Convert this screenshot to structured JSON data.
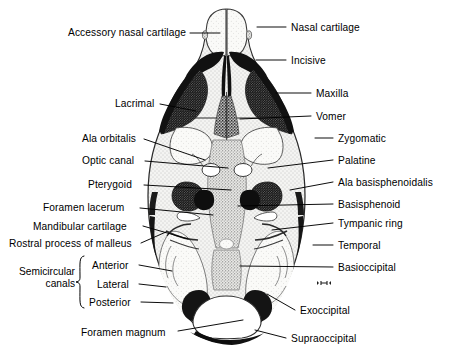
{
  "figure": {
    "colors": {
      "ink": "#000000",
      "background": "#ffffff",
      "bone_dark": "#1a1a1a",
      "bone_mid": "#7a7a7a",
      "bone_light": "#dcdcdc",
      "cartilage": "#f2f2f0"
    }
  },
  "labels_left": [
    {
      "id": "accessory-nasal-cartilage",
      "text": "Accessory nasal cartilage",
      "text_x": 68,
      "text_y": 27,
      "line": [
        [
          190,
          33
        ],
        [
          220,
          33
        ]
      ]
    },
    {
      "id": "lacrimal",
      "text": "Lacrimal",
      "text_x": 115,
      "text_y": 98,
      "line": [
        [
          160,
          104
        ],
        [
          196,
          111
        ]
      ]
    },
    {
      "id": "ala-orbitalis",
      "text": "Ala orbitalis",
      "text_x": 82,
      "text_y": 133,
      "line": [
        [
          144,
          139
        ],
        [
          205,
          160
        ]
      ]
    },
    {
      "id": "optic-canal",
      "text": "Optic canal",
      "text_x": 82,
      "text_y": 155,
      "line": [
        [
          145,
          161
        ],
        [
          228,
          168
        ]
      ]
    },
    {
      "id": "pterygoid",
      "text": "Pterygoid",
      "text_x": 88,
      "text_y": 179,
      "line": [
        [
          144,
          185
        ],
        [
          231,
          190
        ]
      ]
    },
    {
      "id": "foramen-lacerum",
      "text": "Foramen lacerum",
      "text_x": 43,
      "text_y": 202,
      "line": [
        [
          140,
          208
        ],
        [
          213,
          215
        ]
      ]
    },
    {
      "id": "mandibular-cartilage",
      "text": "Mandibular cartilage",
      "text_x": 33,
      "text_y": 221,
      "line": [
        [
          143,
          226
        ],
        [
          188,
          239
        ]
      ]
    },
    {
      "id": "rostral-process-of-malleus",
      "text": "Rostral process of malleus",
      "text_x": 9,
      "text_y": 238,
      "line": [
        [
          141,
          243
        ],
        [
          166,
          232
        ]
      ]
    },
    {
      "id": "anterior",
      "text": "Anterior",
      "text_x": 92,
      "text_y": 260,
      "line": [
        [
          139,
          265
        ],
        [
          172,
          271
        ]
      ]
    },
    {
      "id": "lateral",
      "text": "Lateral",
      "text_x": 97,
      "text_y": 279,
      "line": [
        [
          139,
          284
        ],
        [
          166,
          287
        ]
      ]
    },
    {
      "id": "posterior",
      "text": "Posterior",
      "text_x": 89,
      "text_y": 297,
      "line": [
        [
          141,
          302
        ],
        [
          173,
          303
        ]
      ]
    },
    {
      "id": "foramen-magnum",
      "text": "Foramen magnum",
      "text_x": 81,
      "text_y": 327,
      "line": [
        [
          178,
          331
        ],
        [
          243,
          320
        ]
      ]
    }
  ],
  "labels_right": [
    {
      "id": "nasal-cartilage",
      "text": "Nasal cartilage",
      "text_x": 291,
      "text_y": 22,
      "line": [
        [
          257,
          27
        ],
        [
          286,
          27
        ]
      ]
    },
    {
      "id": "incisive",
      "text": "Incisive",
      "text_x": 291,
      "text_y": 55,
      "line": [
        [
          256,
          60
        ],
        [
          286,
          60
        ]
      ]
    },
    {
      "id": "maxilla",
      "text": "Maxilla",
      "text_x": 316,
      "text_y": 88,
      "line": [
        [
          276,
          93
        ],
        [
          311,
          93
        ]
      ]
    },
    {
      "id": "vomer",
      "text": "Vomer",
      "text_x": 316,
      "text_y": 111,
      "line": [
        [
          240,
          119
        ],
        [
          311,
          116
        ]
      ]
    },
    {
      "id": "zymgomatic",
      "text": "Zygomatic",
      "text_x": 338,
      "text_y": 133,
      "line": [
        [
          315,
          138
        ],
        [
          333,
          138
        ]
      ]
    },
    {
      "id": "palatine",
      "text": "Palatine",
      "text_x": 338,
      "text_y": 155,
      "line": [
        [
          268,
          168
        ],
        [
          333,
          160
        ]
      ]
    },
    {
      "id": "ala-basisphenoidalis",
      "text": "Ala basisphenoidalis",
      "text_x": 338,
      "text_y": 177,
      "line": [
        [
          290,
          190
        ],
        [
          333,
          182
        ]
      ]
    },
    {
      "id": "basisphenoid",
      "text": "Basisphenoid",
      "text_x": 338,
      "text_y": 199,
      "line": [
        [
          238,
          206
        ],
        [
          333,
          204
        ]
      ]
    },
    {
      "id": "tympanic-ring",
      "text": "Tympanic ring",
      "text_x": 338,
      "text_y": 218,
      "line": [
        [
          272,
          230
        ],
        [
          333,
          223
        ]
      ]
    },
    {
      "id": "temporal",
      "text": "Temporal",
      "text_x": 338,
      "text_y": 240,
      "line": [
        [
          313,
          245
        ],
        [
          333,
          245
        ]
      ]
    },
    {
      "id": "basioccipital",
      "text": "Basioccipital",
      "text_x": 338,
      "text_y": 262,
      "line": [
        [
          240,
          266
        ],
        [
          333,
          267
        ]
      ]
    },
    {
      "id": "exoccipital",
      "text": "Exoccipital",
      "text_x": 300,
      "text_y": 305,
      "line": [
        [
          267,
          294
        ],
        [
          295,
          310
        ]
      ]
    },
    {
      "id": "supraoccipital",
      "text": "Supraoccipital",
      "text_x": 291,
      "text_y": 333,
      "line": [
        [
          255,
          330
        ],
        [
          286,
          338
        ]
      ]
    }
  ],
  "group_label": {
    "id": "semicircular-canals",
    "line1": "Semicircular",
    "line2": "canals",
    "x": 18,
    "y": 266,
    "brace_x": 79,
    "brace_top": 256,
    "brace_bottom": 308
  },
  "scale_bar": {
    "x": 321,
    "y": 281,
    "text": ""
  }
}
